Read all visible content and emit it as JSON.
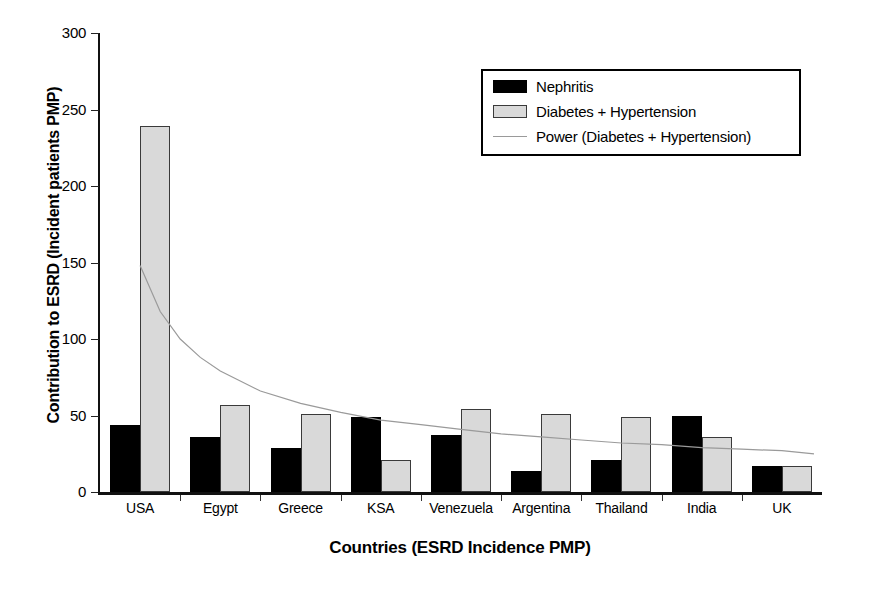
{
  "chart_data": {
    "type": "bar",
    "title": "",
    "xlabel": "Countries (ESRD Incidence PMP)",
    "ylabel": "Contribution to ESRD (Incident patients PMP)",
    "categories": [
      "USA",
      "Egypt",
      "Greece",
      "KSA",
      "Venezuela",
      "Argentina",
      "Thailand",
      "India",
      "UK"
    ],
    "series": [
      {
        "name": "Nephritis",
        "color": "#000000",
        "values": [
          44,
          36,
          29,
          49,
          37,
          14,
          21,
          50,
          17
        ]
      },
      {
        "name": "Diabetes + Hypertension",
        "color": "#d9d9d9",
        "values": [
          239,
          57,
          51,
          21,
          54,
          51,
          49,
          36,
          17
        ]
      }
    ],
    "trendline": {
      "name": "Power (Diabetes + Hypertension)",
      "color": "#9a9a9a",
      "points": [
        {
          "x": 0.0,
          "y": 148
        },
        {
          "x": 0.25,
          "y": 118
        },
        {
          "x": 0.5,
          "y": 100
        },
        {
          "x": 0.75,
          "y": 88
        },
        {
          "x": 1.0,
          "y": 79
        },
        {
          "x": 1.5,
          "y": 66
        },
        {
          "x": 2.0,
          "y": 58
        },
        {
          "x": 2.5,
          "y": 52
        },
        {
          "x": 3.0,
          "y": 47
        },
        {
          "x": 3.5,
          "y": 44
        },
        {
          "x": 4.0,
          "y": 41
        },
        {
          "x": 4.5,
          "y": 38
        },
        {
          "x": 5.0,
          "y": 36
        },
        {
          "x": 5.5,
          "y": 34
        },
        {
          "x": 6.0,
          "y": 32
        },
        {
          "x": 6.5,
          "y": 31
        },
        {
          "x": 7.0,
          "y": 29
        },
        {
          "x": 7.5,
          "y": 28
        },
        {
          "x": 8.0,
          "y": 27
        },
        {
          "x": 8.4,
          "y": 25
        }
      ]
    },
    "ylim": [
      0,
      300
    ],
    "yticks": [
      0,
      50,
      100,
      150,
      200,
      250,
      300
    ],
    "ytick_labels": [
      "0",
      "50",
      "100",
      "150",
      "200",
      "250",
      "300"
    ],
    "grid": false,
    "legend_position": "top-right",
    "legend_entries": [
      {
        "label": "Nephritis",
        "swatch": "solid-black"
      },
      {
        "label": "Diabetes + Hypertension",
        "swatch": "solid-gray"
      },
      {
        "label": "Power (Diabetes + Hypertension)",
        "swatch": "line"
      }
    ]
  }
}
